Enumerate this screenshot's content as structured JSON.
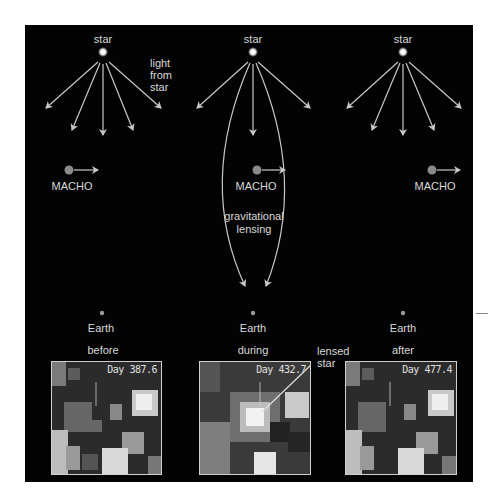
{
  "diagram": {
    "colors": {
      "background": "#030303",
      "stroke": "#c8c8c8",
      "text": "#d8d8d8",
      "macho": "#8a8a8a",
      "earth": "#9a9a9a"
    },
    "panels": [
      {
        "id": "before",
        "star_label": "star",
        "light_label": "light\nfrom\nstar",
        "macho_label": "MACHO",
        "earth_label": "Earth",
        "phase_label": "before",
        "image_day": "Day 387.6"
      },
      {
        "id": "during",
        "star_label": "star",
        "macho_label": "MACHO",
        "lensing_label_1": "gravitational",
        "lensing_label_2": "lensing",
        "earth_label": "Earth",
        "phase_label": "during",
        "image_day": "Day 432.7",
        "callout_label_1": "lensed",
        "callout_label_2": "star"
      },
      {
        "id": "after",
        "star_label": "star",
        "macho_label": "MACHO",
        "earth_label": "Earth",
        "phase_label": "after",
        "image_day": "Day 477.4"
      }
    ]
  }
}
